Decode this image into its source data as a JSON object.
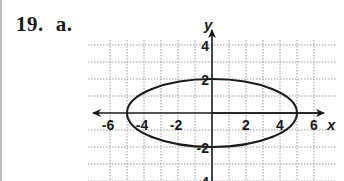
{
  "problem": {
    "number": "19.",
    "part": "a."
  },
  "chart_data": {
    "type": "line",
    "title": "",
    "xlabel": "x",
    "ylabel": "y",
    "xlim": [
      -6,
      6
    ],
    "ylim": [
      -4,
      4
    ],
    "grid": true,
    "grid_style": "dotted",
    "x_ticks": [
      -6,
      -4,
      -2,
      2,
      4,
      6
    ],
    "x_tick_labels": [
      "-6",
      "-4",
      "-2",
      "2",
      "4",
      "6"
    ],
    "y_ticks": [
      4,
      2,
      -2,
      -4
    ],
    "y_tick_labels": [
      "4",
      "2",
      "-2",
      "-4"
    ],
    "series": [
      {
        "name": "ellipse",
        "shape": "ellipse",
        "center": [
          0,
          0
        ],
        "semi_major_x": 5,
        "semi_minor_y": 2,
        "vertices": [
          [
            -5,
            0
          ],
          [
            5,
            0
          ],
          [
            0,
            2
          ],
          [
            0,
            -2
          ]
        ]
      }
    ],
    "colors": {
      "curve": "#1a1a1a",
      "axes": "#1a1a1a",
      "grid": "#9a9a9a"
    }
  }
}
